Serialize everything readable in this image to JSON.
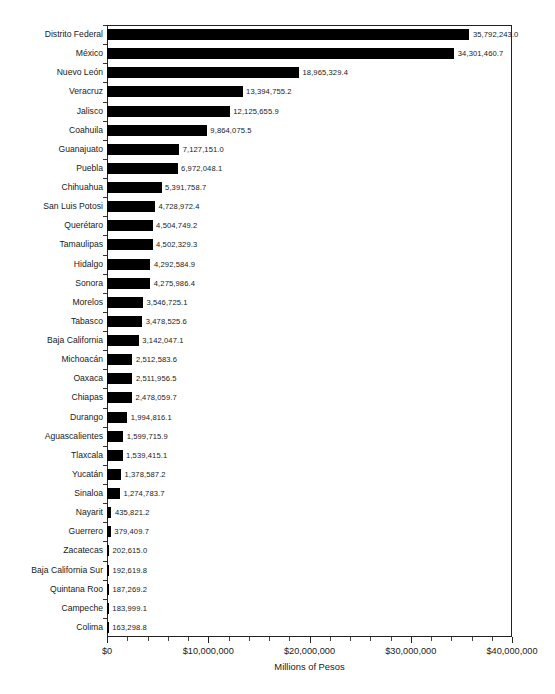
{
  "chart_data": {
    "type": "bar",
    "orientation": "horizontal",
    "title": "",
    "xlabel": "Millions of Pesos",
    "ylabel": "",
    "xlim": [
      0,
      40000000
    ],
    "xtick_labels": [
      "$0",
      "$10,000,000",
      "$20,000,000",
      "$30,000,000",
      "$40,000,000"
    ],
    "xtick_values": [
      0,
      10000000,
      20000000,
      30000000,
      40000000
    ],
    "minor_tick_step": 2000000,
    "grid": false,
    "legend": null,
    "bar_color": "#000000",
    "categories": [
      "Distrito Federal",
      "México",
      "Nuevo León",
      "Veracruz",
      "Jalisco",
      "Coahuila",
      "Guanajuato",
      "Puebla",
      "Chihuahua",
      "San Luis Potosi",
      "Querétaro",
      "Tamaulipas",
      "Hidalgo",
      "Sonora",
      "Morelos",
      "Tabasco",
      "Baja California",
      "Michoacán",
      "Oaxaca",
      "Chiapas",
      "Durango",
      "Aguascalientes",
      "Tlaxcala",
      "Yucatán",
      "Sinaloa",
      "Nayarit",
      "Guerrero",
      "Zacatecas",
      "Baja California Sur",
      "Quintana Roo",
      "Campeche",
      "Colima"
    ],
    "values": [
      35792243.0,
      34301460.7,
      18965329.4,
      13394755.2,
      12125655.9,
      9864075.5,
      7127151.0,
      6972048.1,
      5391758.7,
      4728972.4,
      4504749.2,
      4502329.3,
      4292584.9,
      4275986.4,
      3546725.1,
      3478525.6,
      3142047.1,
      2512583.6,
      2511956.5,
      2478059.7,
      1994816.1,
      1599715.9,
      1539415.1,
      1378587.2,
      1274783.7,
      435821.2,
      379409.7,
      202615.0,
      192619.8,
      187269.2,
      183999.1,
      163298.8
    ],
    "value_labels": [
      "35,792,243.0",
      "34,301,460.7",
      "18,965,329.4",
      "13,394,755.2",
      "12,125,655.9",
      "9,864,075.5",
      "7,127,151.0",
      "6,972,048.1",
      "5,391,758.7",
      "4,728,972.4",
      "4,504,749.2",
      "4,502,329.3",
      "4,292,584.9",
      "4,275,986.4",
      "3,546,725.1",
      "3,478,525.6",
      "3,142,047.1",
      "2,512,583.6",
      "2,511,956.5",
      "2,478,059.7",
      "1,994,816.1",
      "1,599,715.9",
      "1,539,415.1",
      "1,378,587.2",
      "1,274,783.7",
      "435,821.2",
      "379,409.7",
      "202,615.0",
      "192,619.8",
      "187,269.2",
      "183,999.1",
      "163,298.8"
    ]
  }
}
